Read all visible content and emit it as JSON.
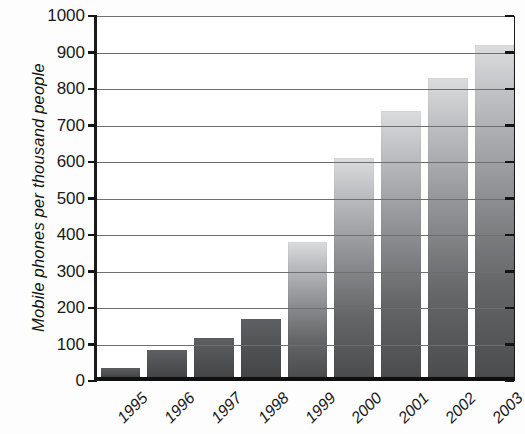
{
  "chart_data": {
    "type": "bar",
    "title": "",
    "subtitle": "",
    "xlabel": "",
    "ylabel": "Mobile phones per thousand people",
    "categories": [
      "1995",
      "1996",
      "1997",
      "1998",
      "1999",
      "2000",
      "2001",
      "2002",
      "2003"
    ],
    "values": [
      25,
      75,
      108,
      160,
      370,
      600,
      730,
      820,
      910
    ],
    "series": [
      {
        "name": "Mobile phones per thousand people",
        "values": [
          25,
          75,
          108,
          160,
          370,
          600,
          730,
          820,
          910
        ]
      }
    ],
    "ylim": [
      0,
      1000
    ],
    "ytick_labels": [
      "0",
      "100",
      "200",
      "300",
      "400",
      "500",
      "600",
      "700",
      "800",
      "900",
      "1000"
    ],
    "ytick_values": [
      0,
      100,
      200,
      300,
      400,
      500,
      600,
      700,
      800,
      900,
      1000
    ],
    "grid": true,
    "grid_axis": "y",
    "legend": false,
    "legend_position": "none",
    "annotations": [],
    "bar_fill": "#8e9093",
    "bar_fill_top": "#dadcde",
    "bar_fill_bottom": "#4b4c4e",
    "axis_color": "#141414",
    "grid_color": "#6e6e6e",
    "background": "#ffffff",
    "xtick_rotation": -45
  }
}
